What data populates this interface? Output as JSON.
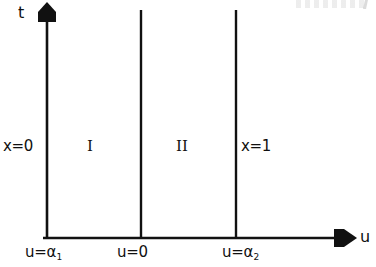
{
  "figure": {
    "kind": "coordinate-axes-diagram",
    "background_color": "#ffffff",
    "line_color": "#111111",
    "axes": {
      "vertical": {
        "name": "t",
        "arrow": "up-arrow-icon",
        "x": 47,
        "y_top": 4,
        "y_bottom": 238
      },
      "horizontal": {
        "name": "u",
        "arrow": "right-arrow-icon",
        "y": 238,
        "x_left": 43,
        "x_right": 356
      }
    },
    "boundary_lines": [
      {
        "name": "x=0",
        "label": "x=0",
        "x": 47,
        "y_top": 4,
        "y_bottom": 238
      },
      {
        "name": "middle",
        "label": "",
        "x": 141,
        "y_top": 10,
        "y_bottom": 238
      },
      {
        "name": "x=1",
        "label": "x=1",
        "x": 236,
        "y_top": 10,
        "y_bottom": 238
      }
    ],
    "regions": [
      {
        "id": "I",
        "label": "I",
        "x": 94,
        "y": 146
      },
      {
        "id": "II",
        "label": "II",
        "x": 183,
        "y": 146
      }
    ],
    "axis_tick_labels": [
      {
        "id": "u-alpha-1",
        "text": "u=",
        "symbol": "α",
        "subscript": "1",
        "at_x": 47
      },
      {
        "id": "u-zero",
        "text": "u=0",
        "symbol": "",
        "subscript": "",
        "at_x": 141
      },
      {
        "id": "u-alpha-2",
        "text": "u=",
        "symbol": "α",
        "subscript": "2",
        "at_x": 236
      }
    ]
  },
  "labels": {
    "t_axis": "t",
    "u_axis": "u",
    "x_zero": "x=0",
    "x_one": "x=1",
    "region_one": "I",
    "region_two": "II",
    "u_alpha_one_prefix": "u=α",
    "u_alpha_one_sub": "1",
    "u_zero": "u=0",
    "u_alpha_two_prefix": "u=α",
    "u_alpha_two_sub": "2"
  }
}
